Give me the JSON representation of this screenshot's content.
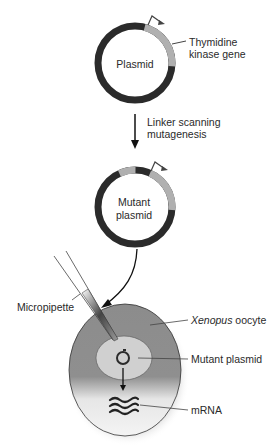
{
  "diagram": {
    "plasmid": {
      "label": "Plasmid",
      "gene_label_line1": "Thymidine",
      "gene_label_line2": "kinase gene"
    },
    "step": {
      "label_line1": "Linker scanning",
      "label_line2": "mutagenesis"
    },
    "mutant_plasmid": {
      "label_line1": "Mutant",
      "label_line2": "plasmid"
    },
    "injection": {
      "micropipette_label": "Micropipette",
      "oocyte_label_italic": "Xenopus",
      "oocyte_label_rest": " oocyte",
      "inner_plasmid_label": "Mutant plasmid",
      "mrna_label": "mRNA"
    },
    "colors": {
      "backbone": "#2b2b2b",
      "gene": "#b0b0b0",
      "oocyte_dark": "#8a8a8a",
      "nucleus": "#cfcfcf",
      "background": "#ffffff"
    }
  }
}
